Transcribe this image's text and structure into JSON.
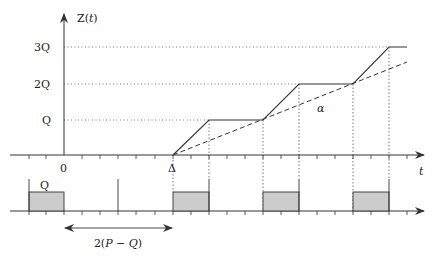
{
  "diagram": {
    "y_axis_label": "Z(t)",
    "x_axis_label": "t",
    "y_ticks": [
      "Q",
      "2Q",
      "3Q"
    ],
    "x_markers": {
      "origin": "0",
      "delta": "Δ"
    },
    "slope_label": "α",
    "batch_label": "Q",
    "interval_label": "2(P − Q)",
    "colors": {
      "line": "#333333",
      "fill": "#cccccc",
      "grid": "#555555"
    }
  }
}
